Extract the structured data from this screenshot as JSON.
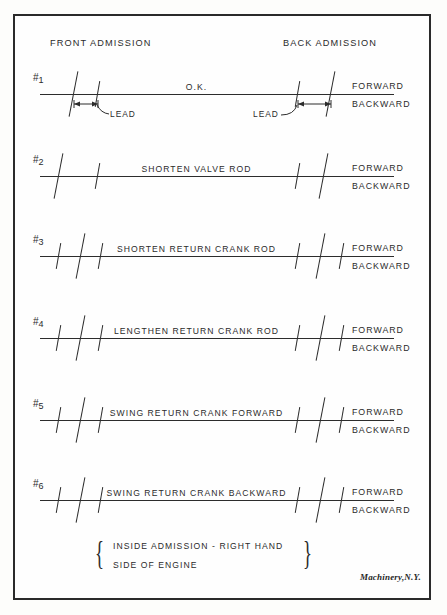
{
  "figure": {
    "credit": "Machinery,N.Y.",
    "headers": {
      "front": "FRONT ADMISSION",
      "back": "BACK ADMISSION"
    },
    "direction_labels": {
      "forward": "FORWARD",
      "backward": "BACKWARD"
    },
    "lead_label": "LEAD",
    "note": {
      "line1": "INSIDE ADMISSION - RIGHT HAND",
      "line2": "SIDE OF ENGINE",
      "brace_left": "{",
      "brace_right": "}"
    },
    "ink_color": "#2c2c2c",
    "paper_color": "#fdfdfb"
  },
  "chart_data": {
    "type": "diagram",
    "xlabel": "",
    "ylabel": "",
    "legend": [
      "FORWARD",
      "BACKWARD"
    ],
    "annotations": [
      "FRONT ADMISSION",
      "BACK ADMISSION",
      "LEAD"
    ],
    "rows": [
      {
        "number": "1",
        "hash": "#",
        "caption": "O.K.",
        "caption_x": 196,
        "has_lead": true,
        "ticks": [
          {
            "x": 73,
            "len": "long"
          },
          {
            "x": 97,
            "len": "short"
          },
          {
            "x": 297,
            "len": "short"
          },
          {
            "x": 330,
            "len": "long"
          }
        ]
      },
      {
        "number": "2",
        "hash": "#",
        "caption": "SHORTEN VALVE ROD",
        "caption_x": 196,
        "has_lead": false,
        "ticks": [
          {
            "x": 58,
            "len": "long"
          },
          {
            "x": 97,
            "len": "short"
          },
          {
            "x": 297,
            "len": "short"
          },
          {
            "x": 323,
            "len": "long"
          }
        ]
      },
      {
        "number": "3",
        "hash": "#",
        "caption": "SHORTEN RETURN CRANK ROD",
        "caption_x": 196,
        "has_lead": false,
        "ticks": [
          {
            "x": 58,
            "len": "short"
          },
          {
            "x": 80,
            "len": "long"
          },
          {
            "x": 100,
            "len": "short"
          },
          {
            "x": 297,
            "len": "short"
          },
          {
            "x": 320,
            "len": "long"
          },
          {
            "x": 341,
            "len": "short"
          }
        ]
      },
      {
        "number": "4",
        "hash": "#",
        "caption": "LENGTHEN RETURN CRANK ROD",
        "caption_x": 196,
        "has_lead": false,
        "ticks": [
          {
            "x": 58,
            "len": "short"
          },
          {
            "x": 80,
            "len": "long"
          },
          {
            "x": 100,
            "len": "short"
          },
          {
            "x": 297,
            "len": "short"
          },
          {
            "x": 320,
            "len": "long"
          },
          {
            "x": 341,
            "len": "short"
          }
        ]
      },
      {
        "number": "5",
        "hash": "#",
        "caption": "SWING RETURN CRANK FORWARD",
        "caption_x": 196,
        "has_lead": false,
        "ticks": [
          {
            "x": 58,
            "len": "short"
          },
          {
            "x": 80,
            "len": "long"
          },
          {
            "x": 100,
            "len": "short"
          },
          {
            "x": 297,
            "len": "short"
          },
          {
            "x": 320,
            "len": "long"
          },
          {
            "x": 341,
            "len": "short"
          }
        ]
      },
      {
        "number": "6",
        "hash": "#",
        "caption": "SWING RETURN CRANK BACKWARD",
        "caption_x": 196,
        "has_lead": false,
        "ticks": [
          {
            "x": 58,
            "len": "short"
          },
          {
            "x": 80,
            "len": "long"
          },
          {
            "x": 100,
            "len": "short"
          },
          {
            "x": 297,
            "len": "short"
          },
          {
            "x": 320,
            "len": "long"
          },
          {
            "x": 341,
            "len": "short"
          }
        ]
      }
    ],
    "row_tops": [
      56,
      138,
      218,
      300,
      382,
      462
    ]
  }
}
